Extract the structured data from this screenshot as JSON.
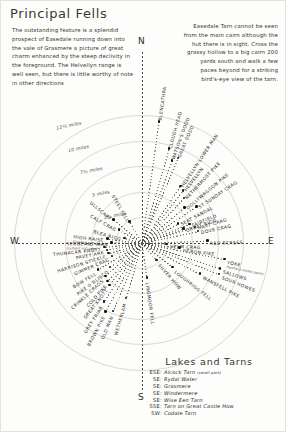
{
  "title": "Principal Fells",
  "notes": {
    "left": "The outstanding feature is a splendid prospect of Easedale running down into the vale of Grasmere a picture of great charm enhanced by the steep declivity in the foreground. The Helvellyn range is well seen, but there is little worthy of note in other directions",
    "right": "Easedale Tarn cannot be seen from the main cairn although the hut there is in sight. Cross the grassy hollow to a big cairn 200 yards south and walk a few paces beyond for a striking bird's-eye view of the tarn."
  },
  "compass": {
    "north": "N",
    "east": "E",
    "south": "S",
    "west": "W"
  },
  "distance_rings": [
    {
      "label": "2½ miles",
      "miles": 2.5
    },
    {
      "label": "5 miles",
      "miles": 5
    },
    {
      "label": "7½ miles",
      "miles": 7.5
    },
    {
      "label": "10 miles",
      "miles": 10
    },
    {
      "label": "12½ miles",
      "miles": 12.5
    }
  ],
  "fells": [
    {
      "name": "BLENCATHRA",
      "bearing": 8,
      "dist": 12.0,
      "sub": ""
    },
    {
      "name": "CLOUGH HEAD",
      "bearing": 16,
      "dist": 9.6,
      "sub": ""
    },
    {
      "name": "WATSON'S DODD",
      "bearing": 20,
      "dist": 8.6,
      "sub": ""
    },
    {
      "name": "GREAT DODD",
      "bearing": 23,
      "dist": 9.0,
      "sub": ""
    },
    {
      "name": "HELVELLYN LOWER MAN",
      "bearing": 34,
      "dist": 6.7,
      "sub": ""
    },
    {
      "name": "HELVELLYN",
      "bearing": 38,
      "dist": 6.5,
      "sub": ""
    },
    {
      "name": "NETHERMOST PIKE",
      "bearing": 43,
      "dist": 6.0,
      "sub": ""
    },
    {
      "name": "DOLLYWAGGON PIKE",
      "bearing": 50,
      "dist": 5.4,
      "sub": ""
    },
    {
      "name": "ST SUNDAY CRAG",
      "bearing": 56,
      "dist": 6.4,
      "sub": ""
    },
    {
      "name": "SEAT SANDAL",
      "bearing": 62,
      "dist": 4.0,
      "sub": ""
    },
    {
      "name": "FAIRFIELD",
      "bearing": 68,
      "dist": 5.0,
      "sub": ""
    },
    {
      "name": "HART CRAG",
      "bearing": 73,
      "dist": 5.4,
      "sub": ""
    },
    {
      "name": "GREAT RIGG",
      "bearing": 71,
      "dist": 4.3,
      "sub": ""
    },
    {
      "name": "DOVE CRAG",
      "bearing": 78,
      "dist": 5.6,
      "sub": ""
    },
    {
      "name": "RED SCREES",
      "bearing": 88,
      "dist": 6.4,
      "sub": ""
    },
    {
      "name": "HELM CRAG",
      "bearing": 92,
      "dist": 2.4,
      "sub": ""
    },
    {
      "name": "HERON PIKE",
      "bearing": 97,
      "dist": 3.7,
      "sub": ""
    },
    {
      "name": "YOKE",
      "bearing": 101,
      "dist": 8.2,
      "sub": "(furthest visible point)"
    },
    {
      "name": "SALLOWS",
      "bearing": 108,
      "dist": 8.0,
      "sub": ""
    },
    {
      "name": "SOUR HOWES",
      "bearing": 112,
      "dist": 8.1,
      "sub": ""
    },
    {
      "name": "WANSFELL PIKE",
      "bearing": 118,
      "dist": 6.4,
      "sub": ""
    },
    {
      "name": "LOUGHRIGG FELL",
      "bearing": 128,
      "dist": 3.8,
      "sub": ""
    },
    {
      "name": "SILVER HOW",
      "bearing": 139,
      "dist": 2.2,
      "sub": ""
    },
    {
      "name": "LINGMOOR FELL",
      "bearing": 172,
      "dist": 3.4,
      "sub": ""
    },
    {
      "name": "WETHERLAM",
      "bearing": 196,
      "dist": 5.6,
      "sub": ""
    },
    {
      "name": "OLD MAN",
      "bearing": 203,
      "dist": 7.2,
      "sub": ""
    },
    {
      "name": "BROWN PIKE",
      "bearing": 208,
      "dist": 7.6,
      "sub": ""
    },
    {
      "name": "GREY FRIAR",
      "bearing": 213,
      "dist": 6.8,
      "sub": ""
    },
    {
      "name": "GREAT KNOTT",
      "bearing": 218,
      "dist": 5.2,
      "sub": ""
    },
    {
      "name": "COLD PIKE",
      "bearing": 222,
      "dist": 5.0,
      "sub": ""
    },
    {
      "name": "CRINKLE CRAGS",
      "bearing": 228,
      "dist": 4.8,
      "sub": ""
    },
    {
      "name": "PIKE O'BLISCO",
      "bearing": 233,
      "dist": 3.9,
      "sub": ""
    },
    {
      "name": "BOW FELL",
      "bearing": 239,
      "dist": 5.0,
      "sub": ""
    },
    {
      "name": "GIMMER CRAG",
      "bearing": 247,
      "dist": 3.2,
      "sub": ""
    },
    {
      "name": "HARRISON STICKLE",
      "bearing": 253,
      "dist": 3.4,
      "sub": ""
    },
    {
      "name": "PAVEY ARK",
      "bearing": 259,
      "dist": 3.5,
      "sub": ""
    },
    {
      "name": "THUNACAR KNOTT",
      "bearing": 264,
      "dist": 3.7,
      "sub": ""
    },
    {
      "name": "SERGEANT MAN",
      "bearing": 271,
      "dist": 3.0,
      "sub": "(summit not seen)"
    },
    {
      "name": "HIGH RAISE",
      "bearing": 277,
      "dist": 3.4,
      "sub": "(summit not seen)"
    },
    {
      "name": "BLEA RIGG",
      "bearing": 286,
      "dist": 1.8,
      "sub": ""
    },
    {
      "name": "CALF CRAG",
      "bearing": 300,
      "dist": 2.6,
      "sub": ""
    },
    {
      "name": "ULLSCARF",
      "bearing": 310,
      "dist": 3.6,
      "sub": ""
    },
    {
      "name": "STEEL FELL",
      "bearing": 330,
      "dist": 2.4,
      "sub": ""
    }
  ],
  "lakes": {
    "title": "Lakes and Tarns",
    "rows": [
      {
        "dir": "ESE",
        "name": "Alcock Tarn",
        "extra": "(small part)"
      },
      {
        "dir": "SE",
        "name": "Rydal Water",
        "extra": ""
      },
      {
        "dir": "SE",
        "name": "Grasmere",
        "extra": ""
      },
      {
        "dir": "SE",
        "name": "Windermere",
        "extra": ""
      },
      {
        "dir": "SE",
        "name": "Wise Een Tarn",
        "extra": ""
      },
      {
        "dir": "SSE",
        "name": "Tarn on Great Castle How",
        "extra": ""
      },
      {
        "dir": "SW",
        "name": "Codale Tarn",
        "extra": ""
      }
    ]
  }
}
